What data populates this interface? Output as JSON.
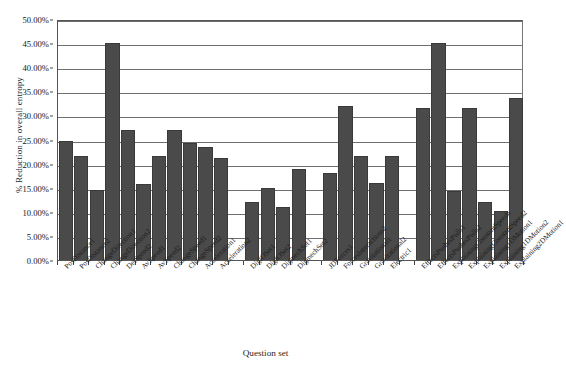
{
  "chart_data": {
    "type": "bar",
    "title": "",
    "xlabel": "Question set",
    "ylabel": "% Reduction in overall entropy",
    "ylim": [
      0,
      0.5
    ],
    "ytick_labels": [
      "0.00%",
      "5.00%",
      "10.00%",
      "15.00%",
      "20.00%",
      "25.00%",
      "30.00%",
      "35.00%",
      "40.00%",
      "45.00%",
      "50.00%"
    ],
    "ytick_values": [
      0,
      0.05,
      0.1,
      0.15,
      0.2,
      0.25,
      0.3,
      0.35,
      0.4,
      0.45,
      0.5
    ],
    "grid": true,
    "legend": "none",
    "value_format": "percent",
    "categories": [
      "PosDistance1",
      "PosDistance2",
      "ChangeDirection1",
      "ChangeDirection2",
      "DetSpeed2",
      "AvSpeed1",
      "AvSpeed2",
      "ChangeSpeed1",
      "ChangeSpeed2",
      "Acceleration1",
      "Acceleration2",
      "",
      "DigIOSet1",
      "DigIOSet2",
      "DigmechSet1",
      "DigmechSet2",
      "",
      "JDForces1",
      "ForcesInteractions2",
      "Gravitational1",
      "Gravitational2",
      "Electric1",
      "",
      "EffectsPushesPulls1",
      "EffectsPushesPulls2",
      "ExplainingConstantSpeed1",
      "ExplainingConstantSpeed2",
      "Explaining1DMotion1",
      "Explaining1DMotion2",
      "Explaining2DMotion1"
    ],
    "values": [
      0.247,
      0.216,
      0.1455,
      0.45,
      0.269,
      0.157,
      0.2165,
      0.269,
      0.243,
      0.2355,
      0.212,
      null,
      0.12,
      0.15,
      0.11,
      0.189,
      null,
      0.18,
      0.319,
      0.215,
      0.1605,
      0.2165,
      null,
      0.315,
      0.45,
      0.144,
      0.315,
      0.121,
      0.101,
      0.337
    ],
    "bar_color": "#4a4a4a",
    "plot_background": "#ffffff"
  }
}
